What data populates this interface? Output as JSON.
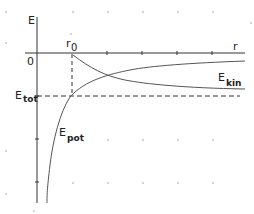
{
  "diagram": {
    "colors": {
      "background": "#ffffff",
      "axis": "#333333",
      "curve": "#555555",
      "dashed": "#333333",
      "grid_dot": "#cfcfcf",
      "text": "#222222"
    },
    "labels": {
      "y_axis": "E",
      "x_axis": "r",
      "origin": "0",
      "r0_main": "r",
      "r0_sub": "0",
      "etot_main": "E",
      "etot_sub": "tot",
      "ekin_main": "E",
      "ekin_sub": "kin",
      "epot_main": "E",
      "epot_sub": "pot"
    },
    "curves": [
      {
        "name": "E_kin",
        "description": "kinetic energy, positive, decreasing from r0 toward asymptote near x-axis... drawn below axis region as mirrored",
        "shape": "decaying"
      },
      {
        "name": "E_pot",
        "description": "potential energy, negative, rising toward 0 as r increases",
        "shape": "-1/r"
      },
      {
        "name": "E_tot",
        "description": "total energy, constant horizontal dashed line",
        "shape": "constant"
      }
    ]
  }
}
